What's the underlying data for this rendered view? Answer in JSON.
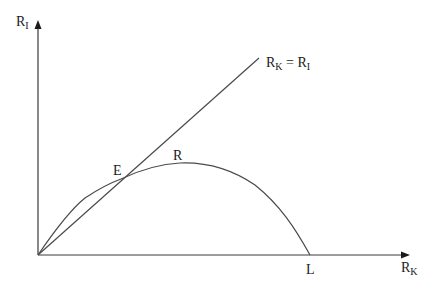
{
  "diagram": {
    "axes": {
      "y_label": "R",
      "y_label_sub": "I",
      "x_label": "R",
      "x_label_sub": "K"
    },
    "line_label": {
      "left": "R",
      "left_sub": "K",
      "equals": " = ",
      "right": "R",
      "right_sub": "I"
    },
    "points": {
      "E": "E",
      "R": "R",
      "L": "L"
    },
    "colors": {
      "line": "#3a3a3a",
      "text": "#1a1a1a",
      "background": "#ffffff"
    }
  }
}
